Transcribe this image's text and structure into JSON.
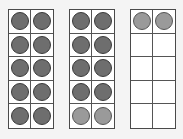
{
  "diagram": {
    "title": "",
    "frames": [
      {
        "name": "ten-frame-1",
        "left": 8,
        "counters": [
          "dark",
          "dark",
          "dark",
          "dark",
          "dark",
          "dark",
          "dark",
          "dark",
          "dark",
          "dark"
        ]
      },
      {
        "name": "ten-frame-2",
        "left": 69,
        "counters": [
          "dark",
          "dark",
          "dark",
          "dark",
          "dark",
          "dark",
          "dark",
          "dark",
          "light",
          "light"
        ]
      },
      {
        "name": "ten-frame-3",
        "left": 130,
        "counters": [
          "light",
          "light",
          "",
          "",
          "",
          "",
          "",
          "",
          "",
          ""
        ]
      }
    ],
    "colors": {
      "dark_counter": "#6e6e6e",
      "light_counter": "#9a9a9a",
      "grid_line": "#4a4a4a",
      "background": "#f4f4f4"
    },
    "total_counters": 22
  }
}
